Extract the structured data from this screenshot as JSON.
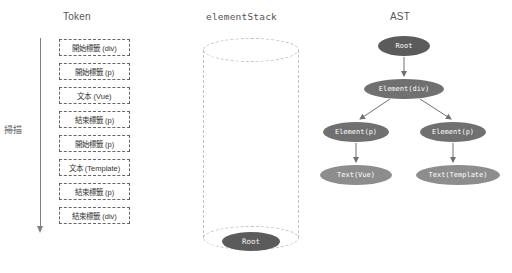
{
  "columns": {
    "token_title": "Token",
    "stack_title": "elementStack",
    "ast_title": "AST"
  },
  "scan": {
    "label": "掃描",
    "arrow_icon": "down-arrow-icon",
    "direction": "down"
  },
  "tokens": [
    {
      "label": "開始標籤 (div)"
    },
    {
      "label": "開始標籤 (p)"
    },
    {
      "label": "文本 (Vue)"
    },
    {
      "label": "結束標籤 (p)"
    },
    {
      "label": "開始標籤 (p)"
    },
    {
      "label": "文本 (Template)"
    },
    {
      "label": "結束標籤 (p)"
    },
    {
      "label": "結束標籤 (div)"
    }
  ],
  "element_stack": {
    "items": [
      {
        "label": "Root"
      }
    ]
  },
  "ast": {
    "nodes": [
      {
        "id": "root",
        "label": "Root"
      },
      {
        "id": "div",
        "label": "Element(div)"
      },
      {
        "id": "p_left",
        "label": "Element(p)"
      },
      {
        "id": "p_right",
        "label": "Element(p)"
      },
      {
        "id": "text_left",
        "label": "Text(Vue)"
      },
      {
        "id": "text_right",
        "label": "Text(Template)"
      }
    ],
    "edges": [
      {
        "from": "root",
        "to": "div"
      },
      {
        "from": "div",
        "to": "p_left"
      },
      {
        "from": "div",
        "to": "p_right"
      },
      {
        "from": "p_left",
        "to": "text_left"
      },
      {
        "from": "p_right",
        "to": "text_right"
      }
    ]
  },
  "colors": {
    "background": "#ffffff",
    "node_dark": "#5b5b5b",
    "node_mid": "#707070",
    "node_light": "#8d8d8d",
    "token_border": "#666666",
    "cylinder_border": "#c2c2c2",
    "axis": "#808080",
    "title_text": "#555555"
  }
}
